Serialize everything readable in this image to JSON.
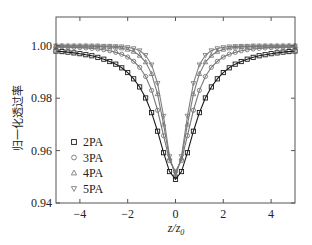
{
  "chart_data": {
    "type": "line",
    "title": "",
    "xlabel": "z/z0",
    "xlabel_main": "z/z",
    "xlabel_sub": "0",
    "ylabel": "归一化透过率",
    "xlim": [
      -5,
      5
    ],
    "ylim": [
      0.94,
      1.011
    ],
    "xticks": [
      -4,
      -2,
      0,
      2,
      4
    ],
    "xtick_labels": [
      "−4",
      "−2",
      "0",
      "2",
      "4"
    ],
    "yticks": [
      0.94,
      0.96,
      0.98,
      1.0
    ],
    "ytick_labels": [
      "0.94",
      "0.96",
      "0.98",
      "1.00"
    ],
    "grid": false,
    "legend_position": "lower left",
    "x": [
      -5,
      -4.75,
      -4.5,
      -4.25,
      -4,
      -3.75,
      -3.5,
      -3.25,
      -3,
      -2.75,
      -2.5,
      -2.25,
      -2,
      -1.75,
      -1.5,
      -1.25,
      -1,
      -0.75,
      -0.5,
      -0.25,
      0,
      0.25,
      0.5,
      0.75,
      1,
      1.25,
      1.5,
      1.75,
      2,
      2.25,
      2.5,
      2.75,
      3,
      3.25,
      3.5,
      3.75,
      4,
      4.25,
      4.5,
      4.75,
      5
    ],
    "series": [
      {
        "name": "2PA",
        "marker": "square",
        "color": "#1a1a1a",
        "values": [
          0.998,
          0.9978,
          0.9976,
          0.9973,
          0.997,
          0.9966,
          0.9962,
          0.9956,
          0.9949,
          0.994,
          0.993,
          0.9916,
          0.9898,
          0.9874,
          0.9843,
          0.9801,
          0.9745,
          0.9674,
          0.9592,
          0.952,
          0.949,
          0.952,
          0.9592,
          0.9674,
          0.9745,
          0.9801,
          0.9843,
          0.9874,
          0.9898,
          0.9916,
          0.993,
          0.994,
          0.9949,
          0.9956,
          0.9962,
          0.9966,
          0.997,
          0.9973,
          0.9976,
          0.9978,
          0.998
        ]
      },
      {
        "name": "3PA",
        "marker": "circle",
        "color": "#777777",
        "values": [
          0.9996,
          0.9996,
          0.9995,
          0.9994,
          0.9993,
          0.9992,
          0.999,
          0.9988,
          0.9985,
          0.9981,
          0.9975,
          0.9968,
          0.9957,
          0.9941,
          0.9918,
          0.9883,
          0.983,
          0.9754,
          0.9657,
          0.9562,
          0.952,
          0.9562,
          0.9657,
          0.9754,
          0.983,
          0.9883,
          0.9918,
          0.9941,
          0.9957,
          0.9968,
          0.9975,
          0.9981,
          0.9985,
          0.9988,
          0.999,
          0.9992,
          0.9993,
          0.9994,
          0.9995,
          0.9996,
          0.9996
        ]
      },
      {
        "name": "4PA",
        "marker": "triangle-up",
        "color": "#7a7a7a",
        "values": [
          1.0,
          1.0,
          0.9999,
          0.9999,
          0.9999,
          0.9999,
          0.9998,
          0.9998,
          0.9997,
          0.9996,
          0.9994,
          0.9991,
          0.9986,
          0.9978,
          0.9963,
          0.9938,
          0.9893,
          0.9816,
          0.97,
          0.9571,
          0.951,
          0.9571,
          0.97,
          0.9816,
          0.9893,
          0.9938,
          0.9963,
          0.9978,
          0.9986,
          0.9991,
          0.9994,
          0.9996,
          0.9997,
          0.9998,
          0.9998,
          0.9999,
          0.9999,
          0.9999,
          0.9999,
          1.0,
          1.0
        ]
      },
      {
        "name": "5PA",
        "marker": "triangle-down",
        "color": "#808080",
        "values": [
          1.0,
          1.0,
          1.0,
          1.0,
          1.0,
          1.0,
          1.0,
          1.0,
          0.9999,
          0.9999,
          0.9998,
          0.9997,
          0.9994,
          0.999,
          0.9982,
          0.9964,
          0.9928,
          0.9857,
          0.9732,
          0.9578,
          0.95,
          0.9578,
          0.9732,
          0.9857,
          0.9928,
          0.9964,
          0.9982,
          0.999,
          0.9994,
          0.9997,
          0.9998,
          0.9999,
          0.9999,
          1.0,
          1.0,
          1.0,
          1.0,
          1.0,
          1.0,
          1.0,
          1.0
        ]
      }
    ]
  },
  "legend": {
    "items": [
      {
        "label": "2PA",
        "marker": "square"
      },
      {
        "label": "3PA",
        "marker": "circle"
      },
      {
        "label": "4PA",
        "marker": "triangle-up"
      },
      {
        "label": "5PA",
        "marker": "triangle-down"
      }
    ]
  },
  "axes": {
    "ylabel": "归一化透过率",
    "xlabel_main": "z/z",
    "xlabel_sub": "0"
  }
}
